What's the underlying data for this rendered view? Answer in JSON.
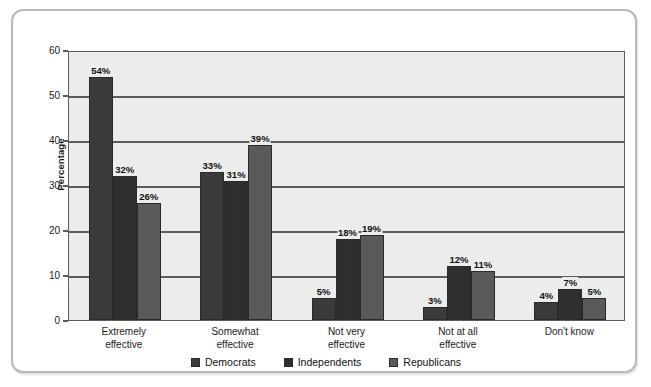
{
  "chart_data": {
    "type": "bar",
    "title": "",
    "subtitle": "",
    "xlabel": "",
    "ylabel": "Percentage",
    "ylim": [
      0,
      60
    ],
    "y_ticks": [
      0,
      10,
      20,
      30,
      40,
      50,
      60
    ],
    "y_tick_labels": [
      "0",
      "10",
      "20",
      "30",
      "40",
      "50",
      "60"
    ],
    "grid": true,
    "grid_axis": "y",
    "legend_position": "bottom-center",
    "value_suffix": "%",
    "categories": [
      "Extremely effective",
      "Somewhat effective",
      "Not very effective",
      "Not at all effective",
      "Don't know"
    ],
    "category_lines": [
      [
        "Extremely",
        "effective"
      ],
      [
        "Somewhat",
        "effective"
      ],
      [
        "Not very",
        "effective"
      ],
      [
        "Not at all",
        "effective"
      ],
      [
        "Don't know",
        ""
      ]
    ],
    "series": [
      {
        "name": "Democrats",
        "color": "#3b3b3b",
        "values": [
          54,
          33,
          5,
          3,
          4
        ],
        "labels": [
          "54%",
          "33%",
          "5%",
          "3%",
          "4%"
        ]
      },
      {
        "name": "Independents",
        "color": "#2f2f2f",
        "values": [
          32,
          31,
          18,
          12,
          7
        ],
        "labels": [
          "32%",
          "31%",
          "18%",
          "12%",
          "7%"
        ]
      },
      {
        "name": "Republicans",
        "color": "#5a5a5a",
        "values": [
          26,
          39,
          19,
          11,
          5
        ],
        "labels": [
          "26%",
          "39%",
          "19%",
          "11%",
          "5%"
        ]
      }
    ]
  },
  "legend": {
    "items": [
      {
        "label": "Democrats",
        "color": "#3b3b3b"
      },
      {
        "label": "Independents",
        "color": "#2f2f2f"
      },
      {
        "label": "Republicans",
        "color": "#5a5a5a"
      }
    ]
  },
  "axis": {
    "y_title": "Percentage"
  },
  "colors": {
    "plot_background": "#ececec",
    "axis_line": "#5c5c5c",
    "card_border": "#b9b9b9",
    "page_background": "#ffffff",
    "label_text": "#111111"
  }
}
